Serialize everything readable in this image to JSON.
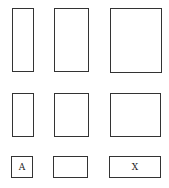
{
  "diagram": {
    "rows": [
      {
        "boxes": [
          {
            "label": ""
          },
          {
            "label": ""
          },
          {
            "label": ""
          }
        ]
      },
      {
        "boxes": [
          {
            "label": ""
          },
          {
            "label": ""
          },
          {
            "label": ""
          }
        ]
      },
      {
        "boxes": [
          {
            "label": "A"
          },
          {
            "label": ""
          },
          {
            "label": "X"
          }
        ]
      }
    ]
  }
}
